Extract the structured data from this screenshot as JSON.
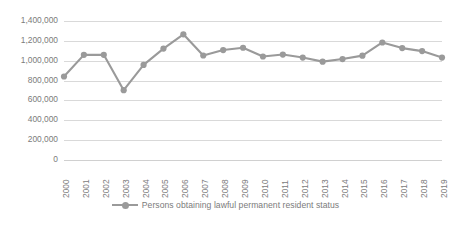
{
  "chart_data": {
    "type": "line",
    "title": "",
    "subtitle": "",
    "xlabel": "",
    "ylabel": "",
    "grid": true,
    "legend_position": "bottom",
    "ylim": [
      0,
      1400000
    ],
    "ytick_step": 200000,
    "ytick_labels": [
      "1,400,000",
      "1,200,000",
      "1,000,000",
      "800,000",
      "600,000",
      "400,000",
      "200,000",
      "0"
    ],
    "ytick_values": [
      1400000,
      1200000,
      1000000,
      800000,
      600000,
      400000,
      200000,
      0
    ],
    "categories": [
      "2000",
      "2001",
      "2002",
      "2003",
      "2004",
      "2005",
      "2006",
      "2007",
      "2008",
      "2009",
      "2010",
      "2011",
      "2012",
      "2013",
      "2014",
      "2015",
      "2016",
      "2017",
      "2018",
      "2019"
    ],
    "series": [
      {
        "name": "Persons obtaining lawful permanent resident status",
        "color": "#9a9a9a",
        "marker": "circle",
        "values": [
          841002,
          1058902,
          1059356,
          703542,
          957883,
          1122257,
          1266129,
          1052415,
          1107126,
          1130818,
          1042625,
          1062040,
          1031631,
          990553,
          1016518,
          1051031,
          1183505,
          1127167,
          1096611,
          1031765
        ]
      }
    ]
  },
  "legend": {
    "entries": [
      {
        "label": "Persons obtaining lawful permanent resident status"
      }
    ]
  },
  "colors": {
    "series": "#9a9a9a",
    "gridline": "#d9d9d9",
    "tick_text": "#7b7b7b",
    "background": "#ffffff"
  }
}
